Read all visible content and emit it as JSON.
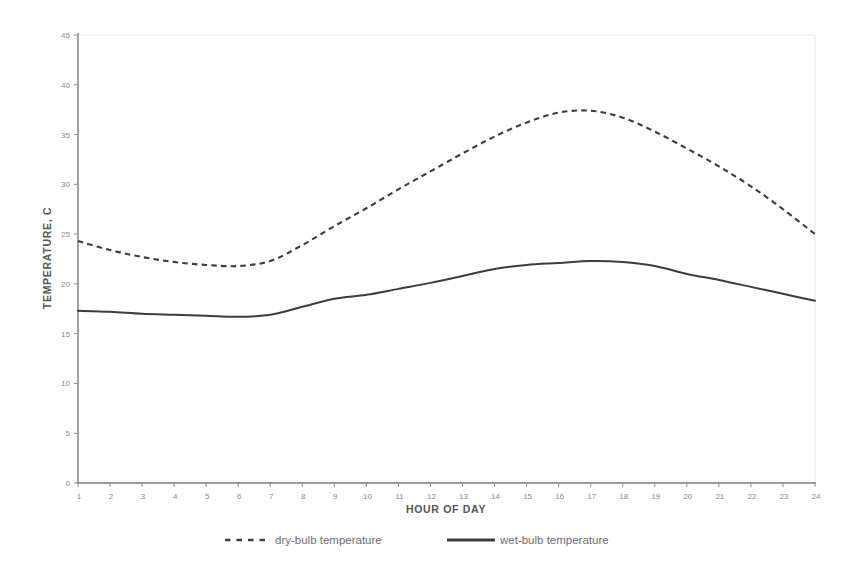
{
  "chart_data": {
    "type": "line",
    "title": "",
    "xlabel": "HOUR OF DAY",
    "ylabel": "TEMPERATURE, C",
    "xlim": [
      1,
      24
    ],
    "ylim": [
      0,
      45
    ],
    "ytick_step": 5,
    "xtick_step": 1,
    "grid": false,
    "legend_position": "bottom",
    "x": [
      1,
      2,
      3,
      4,
      5,
      6,
      7,
      8,
      9,
      10,
      11,
      12,
      13,
      14,
      15,
      16,
      17,
      18,
      19,
      20,
      21,
      22,
      23,
      24
    ],
    "xtick_labels": [
      "1",
      "2",
      "3",
      "4",
      "5",
      "6",
      "7",
      "8",
      "9",
      "10",
      "11",
      "12",
      "13",
      "14",
      "15",
      "16",
      "17",
      "18",
      "19",
      "20",
      "21",
      "22",
      "23",
      "24"
    ],
    "ytick_labels": [
      "0",
      "5",
      "10",
      "15",
      "20",
      "25",
      "30",
      "35",
      "40",
      "45"
    ],
    "ytick_values": [
      0,
      5,
      10,
      15,
      20,
      25,
      30,
      35,
      40,
      45
    ],
    "series": [
      {
        "name": "dry-bulb temperature",
        "style": "dashed",
        "color": "#3b3b46",
        "values": [
          24.3,
          23.4,
          22.7,
          22.2,
          21.9,
          21.8,
          22.3,
          23.9,
          25.8,
          27.6,
          29.5,
          31.3,
          33.1,
          34.8,
          36.2,
          37.2,
          37.4,
          36.7,
          35.3,
          33.6,
          31.8,
          29.8,
          27.5,
          25.0
        ]
      },
      {
        "name": "wet-bulb temperature",
        "style": "solid",
        "color": "#3b3b46",
        "values": [
          17.3,
          17.2,
          17.0,
          16.9,
          16.8,
          16.7,
          16.9,
          17.7,
          18.5,
          18.9,
          19.5,
          20.1,
          20.8,
          21.5,
          21.9,
          22.1,
          22.3,
          22.2,
          21.8,
          21.0,
          20.4,
          19.7,
          19.0,
          18.3
        ]
      }
    ],
    "units": "C"
  },
  "legend": {
    "entries": [
      {
        "label": "dry-bulb temperature",
        "style": "dashed"
      },
      {
        "label": "wet-bulb temperature",
        "style": "solid"
      }
    ]
  },
  "colors": {
    "series": "#3b3b46",
    "axis": "#7a7a7a",
    "tick_text": "#8a8a8a",
    "axis_title": "#555555",
    "legend_text": "#6e6e6e",
    "background": "#ffffff"
  }
}
